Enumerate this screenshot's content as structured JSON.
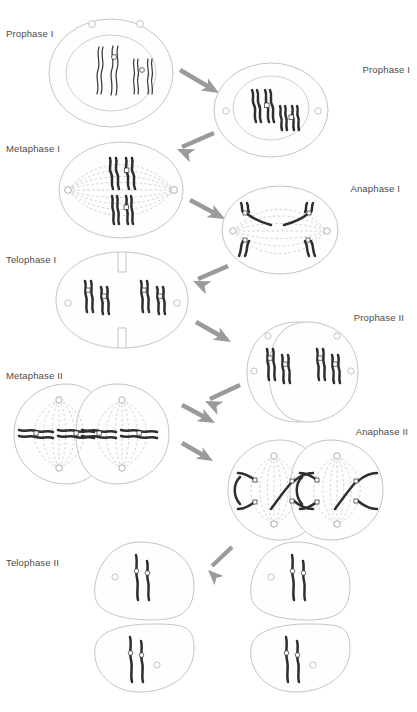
{
  "figure": {
    "type": "biological-process-diagram",
    "background_color": "#ffffff",
    "outline_color": "#b9b9b9",
    "chromosome_color": "#2e2e2e",
    "arrow_color": "#9a9a9a",
    "label_color": "#4a4a4a"
  },
  "labels": {
    "prophase_1_early": "Prophase I",
    "prophase_1_late": "Prophase I",
    "metaphase_1": "Metaphase I",
    "anaphase_1": "Anaphase I",
    "telophase_1": "Telophase I",
    "prophase_2": "Prophase II",
    "metaphase_2": "Metaphase II",
    "anaphase_2": "Anaphase II",
    "telophase_2": "Telophase II"
  },
  "stages": [
    {
      "id": "prophase-1-early",
      "label": "Prophase I",
      "label_side": "left",
      "cells": 1,
      "chromosome_count": 4,
      "features": [
        "nuclear-envelope",
        "nucleolus",
        "thin-wavy-chromosomes",
        "paired-homologs"
      ]
    },
    {
      "id": "prophase-1-late",
      "label": "Prophase I",
      "label_side": "right",
      "cells": 1,
      "chromosome_count": 4,
      "features": [
        "nuclear-envelope",
        "nucleolus",
        "condensed-chromosomes",
        "tetrads"
      ]
    },
    {
      "id": "metaphase-1",
      "label": "Metaphase I",
      "label_side": "left",
      "cells": 1,
      "chromosome_count": 4,
      "features": [
        "spindle-fibers",
        "spindle-poles",
        "chromosomes-at-equator"
      ]
    },
    {
      "id": "anaphase-1",
      "label": "Anaphase I",
      "label_side": "right",
      "cells": 1,
      "chromosome_count": 4,
      "features": [
        "spindle-fibers",
        "homologs-separating",
        "chromosomes-moving-to-poles"
      ]
    },
    {
      "id": "telophase-1",
      "label": "Telophase I",
      "label_side": "left",
      "cells": 1,
      "chromosome_count": 4,
      "features": [
        "cleavage-furrow",
        "nucleoli",
        "two-chromosome-groups"
      ]
    },
    {
      "id": "prophase-2",
      "label": "Prophase II",
      "label_side": "right",
      "cells": 2,
      "chromosome_count": 4,
      "features": [
        "two-daughter-cells",
        "nucleoli",
        "condensed-chromosomes"
      ]
    },
    {
      "id": "metaphase-2",
      "label": "Metaphase II",
      "label_side": "left",
      "cells": 2,
      "chromosome_count": 4,
      "features": [
        "two-spindles",
        "chromosomes-at-equators",
        "spindle-poles"
      ]
    },
    {
      "id": "anaphase-2",
      "label": "Anaphase II",
      "label_side": "right",
      "cells": 2,
      "chromosome_count": 8,
      "features": [
        "two-spindles",
        "sister-chromatids-separating"
      ]
    },
    {
      "id": "telophase-2",
      "label": "Telophase II",
      "label_side": "left",
      "cells": 4,
      "chromosome_count": 8,
      "features": [
        "four-haploid-cells",
        "nucleoli",
        "decondensing-chromosomes"
      ]
    }
  ],
  "arrows": [
    {
      "from": "prophase-1-early",
      "to": "prophase-1-late",
      "direction": "down-right"
    },
    {
      "from": "prophase-1-late",
      "to": "metaphase-1",
      "direction": "down-left"
    },
    {
      "from": "metaphase-1",
      "to": "anaphase-1",
      "direction": "down-right"
    },
    {
      "from": "anaphase-1",
      "to": "telophase-1",
      "direction": "down-left"
    },
    {
      "from": "telophase-1",
      "to": "prophase-2",
      "direction": "down-right"
    },
    {
      "from": "prophase-2",
      "to": "metaphase-2",
      "direction": "down-left"
    },
    {
      "from": "metaphase-2",
      "to": "anaphase-2",
      "direction": "down-right"
    },
    {
      "from": "anaphase-2",
      "to": "telophase-2",
      "direction": "down-left"
    }
  ]
}
